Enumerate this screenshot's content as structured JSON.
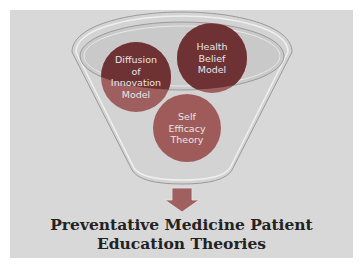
{
  "diagram": {
    "title_line1": "Preventative Medicine Patient",
    "title_line2": "Education Theories",
    "circles": [
      {
        "label_lines": [
          "Diffusion",
          "of",
          "Innovation",
          "Model"
        ],
        "color": "#7a3a3c"
      },
      {
        "label_lines": [
          "Health",
          "Belief",
          "Model"
        ],
        "color": "#6e3033"
      },
      {
        "label_lines": [
          "Self",
          "Efficacy",
          "Theory"
        ],
        "color": "#9e5a59"
      }
    ],
    "colors": {
      "panel": "#d8d8d8",
      "funnel_fill": "#d1d1d1",
      "funnel_stroke": "#9a9a9a",
      "arrow": "#9f5f60",
      "title": "#222222"
    }
  }
}
